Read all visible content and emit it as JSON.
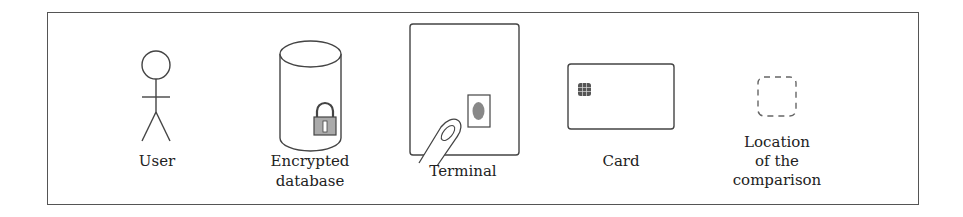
{
  "diagram": {
    "type": "legend",
    "items": [
      {
        "id": "user",
        "label": "User",
        "icon": "stick-figure-icon"
      },
      {
        "id": "database",
        "label_lines": [
          "Encrypted",
          "database"
        ],
        "icon": "cylinder-with-padlock-icon"
      },
      {
        "id": "terminal",
        "label": "Terminal",
        "icon": "terminal-with-fingerprint-sensor-and-finger-icon"
      },
      {
        "id": "card",
        "label": "Card",
        "icon": "chip-card-icon"
      },
      {
        "id": "comparison",
        "label_lines": [
          "Location",
          "of the",
          "comparison"
        ],
        "icon": "dashed-rounded-square-icon"
      }
    ]
  },
  "colors": {
    "stroke": "#444444",
    "frame": "#555555",
    "padlock_fill": "#aaaaaa",
    "dashed": "#666666"
  }
}
